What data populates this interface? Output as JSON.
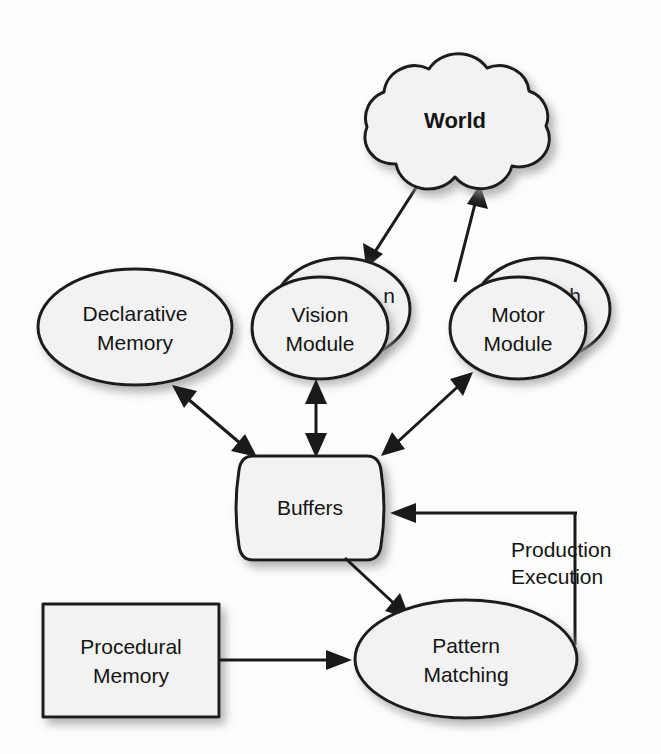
{
  "diagram": {
    "type": "block-diagram",
    "background_color": "#fdfdfd",
    "shape_fill_color": "#f2f2f2",
    "stroke_color": "#1a1a1a",
    "text_color": "#141414",
    "nodes": [
      {
        "id": "world",
        "label": "World",
        "shape": "cloud",
        "bold": true,
        "cx": 455,
        "cy": 122
      },
      {
        "id": "declarative-memory",
        "label_line1": "Declarative",
        "label_line2": "Memory",
        "shape": "ellipse",
        "cx": 135,
        "cy": 327
      },
      {
        "id": "vision-module",
        "label_line1": "Vision",
        "label_line2": "Module",
        "shape": "ellipse-stack",
        "cx": 322,
        "cy": 328,
        "ghost_label": "n"
      },
      {
        "id": "motor-module",
        "label_line1": "Motor",
        "label_line2": "Module",
        "shape": "ellipse-stack",
        "cx": 520,
        "cy": 328,
        "ghost_label": "h"
      },
      {
        "id": "buffers",
        "label": "Buffers",
        "shape": "barrel",
        "cx": 310,
        "cy": 508
      },
      {
        "id": "procedural-memory",
        "label_line1": "Procedural",
        "label_line2": "Memory",
        "shape": "rectangle",
        "cx": 131,
        "cy": 660
      },
      {
        "id": "pattern-matching",
        "label_line1": "Pattern",
        "label_line2": "Matching",
        "shape": "ellipse",
        "cx": 466,
        "cy": 659
      }
    ],
    "edges": [
      {
        "id": "world-to-vision",
        "from": "world",
        "to": "vision-module",
        "arrow": "single",
        "label": ""
      },
      {
        "id": "motor-to-world",
        "from": "motor-module",
        "to": "world",
        "arrow": "single",
        "label": ""
      },
      {
        "id": "declarative-buffers",
        "from": "declarative-memory",
        "to": "buffers",
        "arrow": "double",
        "label": ""
      },
      {
        "id": "vision-buffers",
        "from": "vision-module",
        "to": "buffers",
        "arrow": "double",
        "label": ""
      },
      {
        "id": "motor-buffers",
        "from": "motor-module",
        "to": "buffers",
        "arrow": "double",
        "label": ""
      },
      {
        "id": "buffers-to-pattern-matching",
        "from": "buffers",
        "to": "pattern-matching",
        "arrow": "single",
        "label": ""
      },
      {
        "id": "procedural-to-pattern-matching",
        "from": "procedural-memory",
        "to": "pattern-matching",
        "arrow": "single",
        "label": ""
      },
      {
        "id": "production-execution",
        "from": "pattern-matching",
        "to": "buffers",
        "arrow": "single",
        "label_line1": "Production",
        "label_line2": "Execution",
        "routing": "orthogonal"
      }
    ]
  }
}
